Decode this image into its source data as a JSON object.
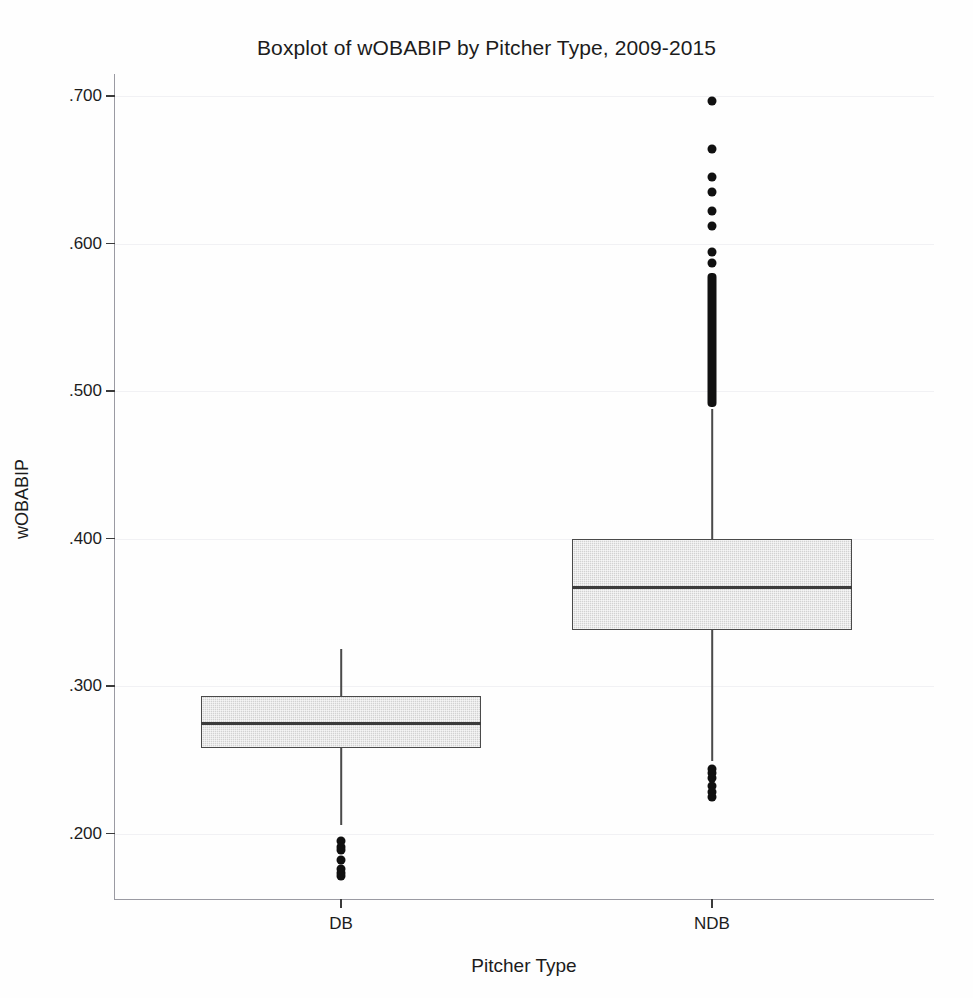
{
  "chart_data": {
    "type": "box",
    "title": "Boxplot of wOBABIP by Pitcher Type, 2009-2015",
    "xlabel": "Pitcher Type",
    "ylabel": "wOBABIP",
    "ylim": [
      0.155,
      0.715
    ],
    "yticks": [
      0.2,
      0.3,
      0.4,
      0.5,
      0.6,
      0.7
    ],
    "ytick_labels": [
      ".200",
      ".300",
      ".400",
      ".500",
      ".600",
      ".700"
    ],
    "grid": true,
    "legend": null,
    "categories": [
      "DB",
      "NDB"
    ],
    "boxes": [
      {
        "category": "DB",
        "whisker_low": 0.206,
        "q1": 0.258,
        "median": 0.275,
        "q3": 0.293,
        "whisker_high": 0.325,
        "outliers_low": [
          0.195,
          0.191,
          0.189,
          0.182,
          0.176,
          0.173,
          0.171
        ],
        "outliers_high": []
      },
      {
        "category": "NDB",
        "whisker_low": 0.249,
        "q1": 0.338,
        "median": 0.367,
        "q3": 0.4,
        "whisker_high": 0.488,
        "outliers_low": [
          0.244,
          0.241,
          0.238,
          0.232,
          0.228,
          0.225
        ],
        "outliers_high": [
          0.697,
          0.664,
          0.645,
          0.635,
          0.622,
          0.612,
          0.594,
          0.587
        ],
        "outliers_high_dense_range": [
          0.489,
          0.58
        ]
      }
    ]
  },
  "axis": {
    "y_title": "wOBABIP",
    "x_title": "Pitcher Type",
    "y_tick_labels": [
      ".700",
      ".600",
      ".500",
      ".400",
      ".300",
      ".200"
    ],
    "x_tick_labels": [
      "DB",
      "NDB"
    ]
  },
  "style": {
    "box_fill": "#d2d2d2",
    "box_border": "#4a4a4a",
    "median_color": "#3c3c3c",
    "outlier_color": "#101010",
    "grid_color": "#f1f1f4",
    "axis_color": "#9a9aa2",
    "text_color": "#1c1c1c",
    "background": "#ffffff"
  }
}
